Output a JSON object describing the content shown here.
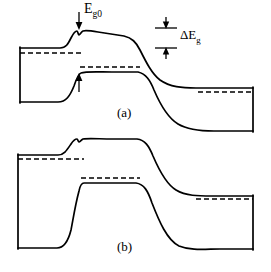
{
  "figure": {
    "title": "",
    "type": "semiconductor-energy-band-diagram",
    "background_color": "#ffffff",
    "line_color": "#000000",
    "width": 271,
    "height": 272
  },
  "labels": {
    "band_gap_zero": {
      "base": "E",
      "subscript": "g0",
      "full": "Eg0"
    },
    "band_gap_delta": {
      "base": "ΔE",
      "subscript": "g",
      "full": "ΔEg"
    },
    "panel_a": "(a)",
    "panel_b": "(b)"
  },
  "panels": [
    {
      "id": "a",
      "caption": "(a)",
      "caption_x": 124,
      "caption_y": 113,
      "left_edge_x": 20,
      "right_edge_x": 253,
      "conduction_band": {
        "name": "conduction-band-edge",
        "path": "M 20 48 L 60 48 C 66 48 68 44 71 38 C 73 34 75 31 77 31 C 78 31 78 35 79 35 C 80 35 81 32 83 31 C 86 30 92 31 98 32 L 124 36 C 132 38 136 42 140 50 C 146 62 152 74 160 80 C 170 87 182 88 196 88 L 253 88"
      },
      "valence_band": {
        "name": "valence-band-edge",
        "path": "M 20 102 L 58 102 C 66 102 70 96 74 86 C 76 80 78 74 81 73 C 86 71 100 72 112 72 L 138 72 C 146 74 150 80 154 90 C 160 104 168 118 178 124 C 188 130 200 131 214 131 L 253 131"
      },
      "fermi_lines": [
        {
          "name": "fermi-level-left",
          "x1": 20,
          "x2": 83,
          "y": 53
        },
        {
          "name": "fermi-level-valence-mid",
          "x1": 80,
          "x2": 140,
          "y": 67
        },
        {
          "name": "fermi-level-right",
          "x1": 198,
          "x2": 253,
          "y": 92
        }
      ],
      "left_edge": {
        "name": "left-boundary-line",
        "x": 20,
        "y1": 48,
        "y2": 102
      },
      "right_edge": {
        "name": "right-boundary-line",
        "x": 253,
        "y1": 88,
        "y2": 131
      },
      "annotations": [
        {
          "name": "eg0-arrow",
          "type": "down-arrow",
          "x": 79,
          "y_top": 12,
          "y_bottom": 29,
          "label": "Eg0"
        },
        {
          "name": "delta-eg-marker",
          "type": "gap-marker",
          "x_left": 155,
          "x_right": 177,
          "y_upper": 28,
          "y_lower": 48,
          "label": "ΔEg"
        },
        {
          "name": "valence-offset-arrow",
          "type": "up-arrow",
          "x": 79,
          "y_top": 74,
          "y_bottom": 92
        }
      ]
    },
    {
      "id": "b",
      "caption": "(b)",
      "caption_x": 124,
      "caption_y": 247,
      "left_edge_x": 18,
      "right_edge_x": 253,
      "conduction_band": {
        "name": "conduction-band-edge",
        "path": "M 18 155 L 58 155 C 64 155 67 150 71 144 C 73 141 75 139 77 139 C 78 139 78 142 79 142 C 80 142 81 140 83 139 C 88 138 100 139 112 139 L 137 139 C 145 140 149 146 153 156 C 159 170 166 184 176 190 C 186 196 198 196 212 196 L 253 196"
      },
      "valence_band": {
        "name": "valence-band-edge",
        "path": "M 18 248 L 57 248 C 65 248 69 240 73 228 C 75 220 77 184 82 183 L 112 183 L 137 183 C 145 185 149 192 153 204 C 160 222 168 240 180 246 C 192 250 206 249 220 249 L 253 249"
      },
      "fermi_lines": [
        {
          "name": "fermi-level-left",
          "x1": 18,
          "x2": 84,
          "y": 159
        },
        {
          "name": "fermi-level-valence-mid",
          "x1": 80,
          "x2": 140,
          "y": 178
        },
        {
          "name": "fermi-level-right",
          "x1": 196,
          "x2": 253,
          "y": 199
        }
      ],
      "left_edge": {
        "name": "left-boundary-line",
        "x": 18,
        "y1": 155,
        "y2": 248
      },
      "right_edge": {
        "name": "right-boundary-line",
        "x": 253,
        "y1": 196,
        "y2": 249
      },
      "annotations": []
    }
  ]
}
